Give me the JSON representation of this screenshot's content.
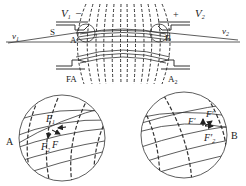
{
  "top_diagram": {
    "labels": {
      "v1": "v",
      "v1_sub": "1",
      "v2": "v",
      "v2_sub": "2",
      "V1": "V",
      "V1_sub": "1",
      "V2": "V",
      "V2_sub": "2",
      "minus": "–",
      "plus": "+",
      "S": "S",
      "A": "A",
      "B": "B",
      "FA": "FA",
      "A2": "A",
      "A2_sub": "2"
    }
  },
  "inset_left": {
    "point_label": "A",
    "force_labels": {
      "F1": "F",
      "F1_sub": "1",
      "F2": "F",
      "F2_sub": "2",
      "F": "F"
    }
  },
  "inset_right": {
    "point_label": "B",
    "force_labels": {
      "F1p": "F′",
      "Fp": "F′",
      "F2p": "F′",
      "F2p_sub": "2"
    }
  },
  "colors": {
    "line": "#333333",
    "text": "#222222"
  }
}
